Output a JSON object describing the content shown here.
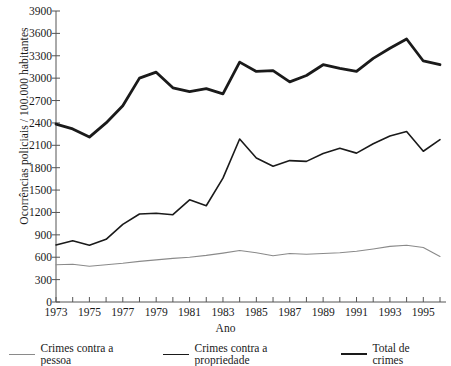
{
  "chart_data": {
    "type": "line",
    "title": "",
    "xlabel": "Ano",
    "ylabel": "Ocorrências policiais / 100.000 habitantes",
    "xlim": [
      1973,
      1996
    ],
    "ylim": [
      0,
      3900
    ],
    "ytick_step": 300,
    "grid": false,
    "legend_position": "bottom",
    "x": [
      1973,
      1974,
      1975,
      1976,
      1977,
      1978,
      1979,
      1980,
      1981,
      1982,
      1983,
      1984,
      1985,
      1986,
      1987,
      1988,
      1989,
      1990,
      1991,
      1992,
      1993,
      1994,
      1995,
      1996
    ],
    "xticklabels": [
      "1973",
      "1975",
      "1977",
      "1979",
      "1981",
      "1983",
      "1985",
      "1987",
      "1989",
      "1991",
      "1993",
      "1995"
    ],
    "yticklabels": [
      "0",
      "300",
      "600",
      "900",
      "1200",
      "1500",
      "1800",
      "2100",
      "2400",
      "2700",
      "3000",
      "3300",
      "3600",
      "3900"
    ],
    "series": [
      {
        "name": "Crimes contra a pessoa",
        "color": "#8a8a8a",
        "width": 1.1,
        "values": [
          500,
          505,
          480,
          500,
          520,
          545,
          565,
          585,
          600,
          625,
          655,
          690,
          660,
          620,
          650,
          640,
          650,
          660,
          680,
          710,
          745,
          760,
          730,
          610
        ]
      },
      {
        "name": "Crimes contra a propriedade",
        "color": "#1a1a1a",
        "width": 1.6,
        "values": [
          765,
          820,
          760,
          840,
          1040,
          1180,
          1190,
          1170,
          1370,
          1290,
          1660,
          2185,
          1930,
          1820,
          1895,
          1885,
          1990,
          2060,
          1995,
          2120,
          2225,
          2285,
          2020,
          2175
        ]
      },
      {
        "name": "Total de crimes",
        "color": "#1a1a1a",
        "width": 2.8,
        "values": [
          2385,
          2320,
          2210,
          2400,
          2630,
          3000,
          3080,
          2870,
          2820,
          2860,
          2790,
          3215,
          3090,
          3100,
          2950,
          3035,
          3180,
          3130,
          3090,
          3265,
          3400,
          3525,
          3230,
          3180
        ]
      }
    ]
  },
  "legend": {
    "items": [
      {
        "label": "Crimes contra a pessoa"
      },
      {
        "label": "Crimes contra a propriedade"
      },
      {
        "label": "Total de crimes"
      }
    ]
  }
}
